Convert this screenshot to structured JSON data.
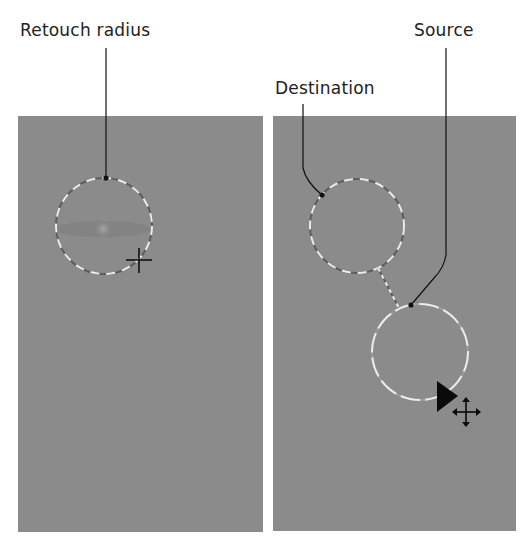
{
  "labels": {
    "retouch_radius": "Retouch radius",
    "source": "Source",
    "destination": "Destination"
  },
  "panels": {
    "left": {
      "description": "Retouch brush placed on image"
    },
    "right": {
      "description": "Dragging source circle away from destination"
    }
  },
  "colors": {
    "panel_gray": "#8b8b8b",
    "dash_light": "#e8e8e8",
    "leader_line": "#111111"
  }
}
